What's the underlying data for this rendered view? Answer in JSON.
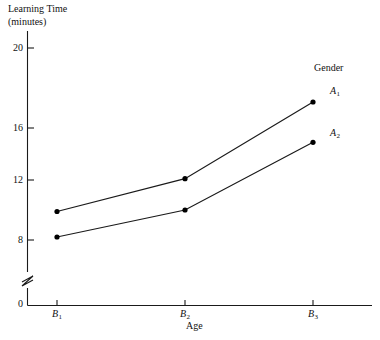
{
  "chart_data": {
    "type": "line",
    "title": "",
    "ylabel": "Learning Time\n(minutes)",
    "xlabel": "Age",
    "categories": [
      "B1",
      "B2",
      "B3"
    ],
    "category_labels": [
      "B",
      "B",
      "B"
    ],
    "category_subscripts": [
      "1",
      "2",
      "3"
    ],
    "series": [
      {
        "name": "A1",
        "label_base": "A",
        "label_sub": "1",
        "values": [
          9.9,
          12.1,
          17.3
        ]
      },
      {
        "name": "A2",
        "label_base": "A",
        "label_sub": "2",
        "values": [
          8.2,
          10.0,
          14.9
        ]
      }
    ],
    "legend_title": "Gender",
    "legend_position": "right",
    "grid": false,
    "ylim": [
      0,
      21
    ],
    "y_ticks": [
      0,
      8,
      12,
      16,
      20
    ],
    "y_tick_labels": [
      "0",
      "8",
      "12",
      "16",
      "20"
    ],
    "axis_break": true,
    "axis_break_between": [
      0,
      8
    ],
    "line_color": "#1a1a1a",
    "marker_color": "#000000",
    "background_color": "#ffffff"
  },
  "axes": {
    "y_title_text": "Learning Time\n(minutes)",
    "x_title_text": "Age"
  },
  "legend": {
    "title": "Gender",
    "entries": [
      {
        "base": "A",
        "sub": "1"
      },
      {
        "base": "A",
        "sub": "2"
      }
    ]
  }
}
